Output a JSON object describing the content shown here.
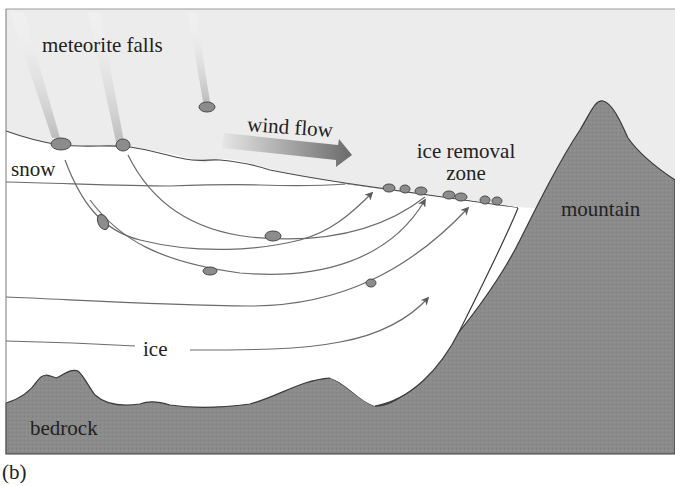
{
  "figure": {
    "caption": "(b)",
    "labels": {
      "meteorite_falls": "meteorite falls",
      "wind_flow": "wind flow",
      "snow": "snow",
      "ice_removal_zone_line1": "ice removal",
      "ice_removal_zone_line2": "zone",
      "mountain": "mountain",
      "ice": "ice",
      "bedrock": "bedrock"
    },
    "colors": {
      "sky": "#ececec",
      "ice": "#ffffff",
      "rock": "#8a8a8a",
      "rock_outline": "#3a3a3a",
      "meteorite": "#8c8c8c",
      "flow_line": "#6b6b6b",
      "arrow_head": "#5a5a5a",
      "wind_arrow_start": "#e4e4e4",
      "wind_arrow_end": "#6a6a6a",
      "text": "#222222"
    },
    "elements": {
      "meteorite_trails": 3,
      "flow_lines": 5,
      "surface_meteorites_in_removal_zone": 8
    }
  }
}
